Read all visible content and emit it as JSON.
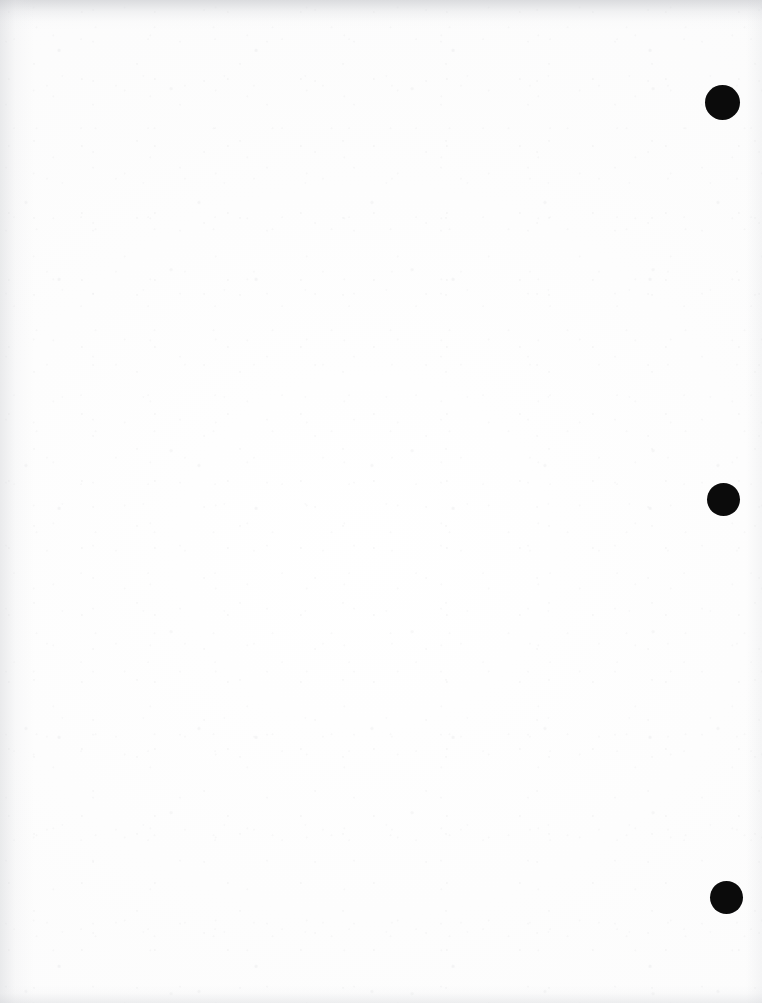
{
  "page": {
    "kind": "scanned-blank-page",
    "width": 762,
    "height": 1003,
    "background_color": "#fdfdfd",
    "body_text": "",
    "visible_text_content": "none"
  },
  "marks": {
    "ink_color": "#0b0b0b",
    "count": 3,
    "shape": "filled-circle",
    "items": [
      {
        "id": "mark-1",
        "cx": 722,
        "cy": 102,
        "diameter": 35
      },
      {
        "id": "mark-2",
        "cx": 723,
        "cy": 499,
        "diameter": 33
      },
      {
        "id": "mark-3",
        "cx": 726,
        "cy": 897,
        "diameter": 33
      }
    ]
  },
  "scan_artifacts": {
    "top_edge_shadow": true,
    "left_edge_shadow": true,
    "bottom_edge_shadow": true,
    "right_edge_shadow": true,
    "paper_texture": true
  }
}
